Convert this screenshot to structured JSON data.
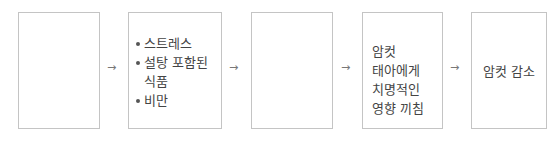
{
  "diagram": {
    "boxes": [
      {
        "id": "box-1",
        "text": ""
      },
      {
        "id": "box-2",
        "items": [
          "스트레스",
          "설탕 포함된 식품",
          "비만"
        ]
      },
      {
        "id": "box-3",
        "text": ""
      },
      {
        "id": "box-4",
        "text": "암컷 태아에게 치명적인 영향 끼침"
      },
      {
        "id": "box-5",
        "text": "암컷 감소"
      }
    ],
    "arrow_glyph": "→"
  }
}
